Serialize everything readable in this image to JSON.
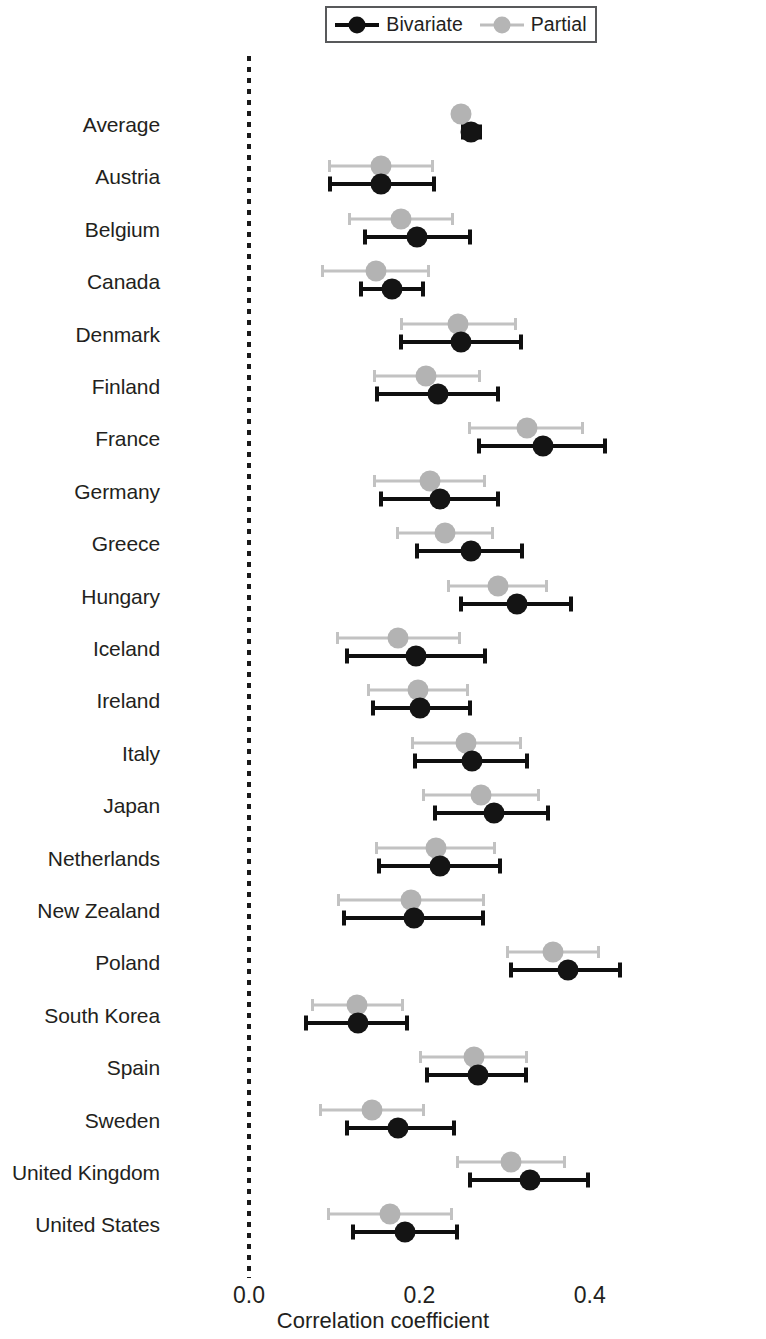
{
  "legend": {
    "entries": [
      {
        "label": "Bivariate",
        "color": "#141414",
        "key": "bivariate"
      },
      {
        "label": "Partial",
        "color": "#b3b3b3",
        "key": "partial"
      }
    ]
  },
  "axis": {
    "x_title": "Correlation coefficient",
    "x_ticks": [
      "0.0",
      "0.2",
      "0.4"
    ],
    "x_tick_values": [
      0.0,
      0.2,
      0.4
    ],
    "zero_reference": 0.0
  },
  "chart_data": {
    "type": "scatter",
    "subtype": "forest-plot",
    "title": "",
    "xlabel": "Correlation coefficient",
    "ylabel": "",
    "xlim": [
      -0.02,
      0.48
    ],
    "grid": false,
    "legend_position": "top",
    "categories": [
      "Average",
      "Austria",
      "Belgium",
      "Canada",
      "Denmark",
      "Finland",
      "France",
      "Germany",
      "Greece",
      "Hungary",
      "Iceland",
      "Ireland",
      "Italy",
      "Japan",
      "Netherlands",
      "New Zealand",
      "Poland",
      "South Korea",
      "Spain",
      "Sweden",
      "United Kingdom",
      "United States"
    ],
    "series": [
      {
        "name": "Bivariate",
        "color": "#141414",
        "values": [
          0.261,
          0.155,
          0.197,
          0.168,
          0.249,
          0.222,
          0.345,
          0.224,
          0.26,
          0.314,
          0.196,
          0.201,
          0.262,
          0.288,
          0.224,
          0.194,
          0.374,
          0.128,
          0.269,
          0.175,
          0.33,
          0.183
        ],
        "ci_low": [
          0.249,
          0.093,
          0.134,
          0.129,
          0.176,
          0.148,
          0.268,
          0.152,
          0.195,
          0.246,
          0.113,
          0.143,
          0.193,
          0.216,
          0.15,
          0.109,
          0.305,
          0.065,
          0.207,
          0.113,
          0.257,
          0.12
        ],
        "ci_high": [
          0.274,
          0.219,
          0.262,
          0.207,
          0.322,
          0.295,
          0.42,
          0.295,
          0.323,
          0.38,
          0.279,
          0.262,
          0.329,
          0.353,
          0.297,
          0.277,
          0.438,
          0.188,
          0.328,
          0.243,
          0.4,
          0.246
        ]
      },
      {
        "name": "Partial",
        "color": "#b3b3b3",
        "values": [
          0.249,
          0.155,
          0.178,
          0.149,
          0.245,
          0.208,
          0.326,
          0.212,
          0.23,
          0.292,
          0.175,
          0.198,
          0.255,
          0.272,
          0.219,
          0.19,
          0.357,
          0.127,
          0.264,
          0.144,
          0.307,
          0.165
        ],
        "ci_low": [
          0.24,
          0.093,
          0.116,
          0.085,
          0.177,
          0.145,
          0.257,
          0.146,
          0.172,
          0.232,
          0.102,
          0.138,
          0.19,
          0.203,
          0.148,
          0.103,
          0.302,
          0.073,
          0.2,
          0.082,
          0.243,
          0.091
        ],
        "ci_high": [
          0.258,
          0.217,
          0.241,
          0.212,
          0.314,
          0.272,
          0.393,
          0.278,
          0.288,
          0.351,
          0.249,
          0.258,
          0.32,
          0.341,
          0.29,
          0.277,
          0.412,
          0.182,
          0.327,
          0.206,
          0.372,
          0.239
        ]
      }
    ]
  }
}
